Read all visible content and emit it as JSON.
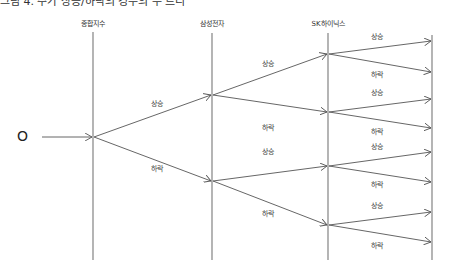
{
  "title_cropped": "그림 4. 주가 상승/하락의 경우의 수 트리",
  "origin_label": "O",
  "columns": [
    {
      "label": "종합지수",
      "x": 93
    },
    {
      "label": "삼성전자",
      "x": 212
    },
    {
      "label": "SK하이닉스",
      "x": 328
    }
  ],
  "labels": {
    "up": "상승",
    "down": "하락"
  },
  "branches": {
    "level1": [
      {
        "label": "상승",
        "x": 157,
        "y": 103
      },
      {
        "label": "하락",
        "x": 157,
        "y": 168
      }
    ],
    "level2": [
      {
        "label": "상승",
        "x": 268,
        "y": 63
      },
      {
        "label": "하락",
        "x": 268,
        "y": 127
      },
      {
        "label": "상승",
        "x": 268,
        "y": 151
      },
      {
        "label": "하락",
        "x": 268,
        "y": 213
      }
    ],
    "level3": [
      {
        "label": "상승",
        "x": 377,
        "y": 47
      },
      {
        "label": "하락",
        "x": 377,
        "y": 74
      },
      {
        "label": "상승",
        "x": 377,
        "y": 92
      },
      {
        "label": "하락",
        "x": 377,
        "y": 131
      },
      {
        "label": "상승",
        "x": 377,
        "y": 145
      },
      {
        "label": "하락",
        "x": 377,
        "y": 184
      },
      {
        "label": "상승",
        "x": 377,
        "y": 205
      },
      {
        "label": "하락",
        "x": 377,
        "y": 245
      }
    ]
  }
}
